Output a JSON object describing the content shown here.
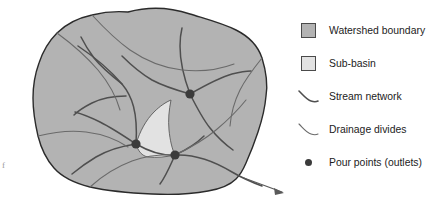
{
  "figure": {
    "credit": "USED BY PERMISSION. COPYRIGHT © ESRI. ALL RIGHTS\nRESERVED.",
    "folio_mark": "f"
  },
  "colors": {
    "watershed_fill": "#b3b3b3",
    "subbasin_fill": "#e2e2e2",
    "boundary_stroke": "#2b2b2b",
    "stream_stroke": "#4f4f4f",
    "divide_stroke": "#6a6a6a",
    "pour_point": "#3b3b3b",
    "background": "#ffffff",
    "text": "#1c1c1c"
  },
  "map": {
    "name": "watershed-map",
    "watershed_label": "Watershed boundary polygon",
    "subbasin_label": "Sub-basin polygon",
    "outlet_arrow_label": "Main outlet flow arrow",
    "pour_points": [
      {
        "id": "pour-point-upper-right",
        "x": 190,
        "y": 94
      },
      {
        "id": "pour-point-center-left",
        "x": 136,
        "y": 144
      },
      {
        "id": "pour-point-center-right",
        "x": 175,
        "y": 155
      }
    ]
  },
  "legend": {
    "name": "map-legend",
    "items": [
      {
        "symbol": "area-swatch-watershed",
        "label": "Watershed boundary"
      },
      {
        "symbol": "area-swatch-subbasin",
        "label": "Sub-basin"
      },
      {
        "symbol": "line-stream",
        "label": "Stream network"
      },
      {
        "symbol": "line-divide",
        "label": "Drainage divides"
      },
      {
        "symbol": "point-pour",
        "label": "Pour points (outlets)"
      }
    ]
  }
}
